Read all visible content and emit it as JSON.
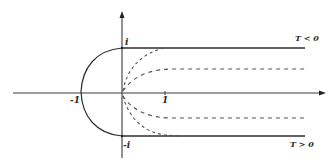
{
  "diagram": {
    "type": "complex-plane contour sketch",
    "colors": {
      "ink": "#333333",
      "dashed": "#555555",
      "background": "#ffffff"
    },
    "axes": {
      "real_axis": {
        "has_arrow": true
      },
      "imag_axis": {
        "has_arrow": true
      }
    },
    "labels": {
      "i": "i",
      "minus_i": "-i",
      "one": "1",
      "minus_one": "-1",
      "t_negative": "T < 0",
      "t_positive": "T > 0"
    },
    "curves": [
      {
        "name": "upper-ray",
        "style": "solid",
        "description": "horizontal ray from i to the right"
      },
      {
        "name": "lower-ray",
        "style": "solid",
        "description": "horizontal ray from -i to the right"
      },
      {
        "name": "left-semicircle",
        "style": "solid",
        "description": "unit semicircle from i through -1 to -i"
      },
      {
        "name": "upper-dashed-inner",
        "style": "dashed",
        "description": "curve from origin approaching i"
      },
      {
        "name": "upper-dashed-outer",
        "style": "dashed",
        "description": "curve from origin approaching intermediate level above axis"
      },
      {
        "name": "lower-dashed-inner",
        "style": "dashed",
        "description": "curve from origin approaching intermediate level below axis"
      },
      {
        "name": "lower-dashed-outer",
        "style": "dashed",
        "description": "curve from origin approaching -i"
      }
    ]
  }
}
